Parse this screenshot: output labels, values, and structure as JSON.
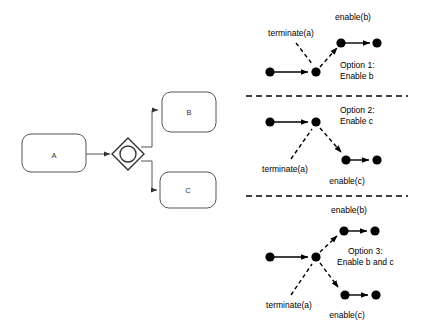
{
  "figure": {
    "background_color": "#ffffff",
    "width": 421,
    "height": 331
  },
  "bpmn": {
    "tasks": [
      {
        "id": "a",
        "label": "A",
        "x": 22,
        "y": 134,
        "w": 64,
        "h": 38
      },
      {
        "id": "b",
        "label": "B",
        "x": 162,
        "y": 92,
        "w": 54,
        "h": 40
      },
      {
        "id": "c",
        "label": "C",
        "x": 160,
        "y": 172,
        "w": 56,
        "h": 36
      }
    ],
    "gateway": {
      "type": "event-based-gateway",
      "cx": 128,
      "cy": 154,
      "half": 16
    },
    "flows": [
      {
        "from": "A",
        "to": "gateway"
      },
      {
        "from": "gateway",
        "to": "B"
      },
      {
        "from": "gateway",
        "to": "C"
      }
    ]
  },
  "options": [
    {
      "id": "option-1",
      "title": "Option 1:",
      "subtitle": "Enable b",
      "transition_label": "terminate(a)",
      "place_labels": [
        "enable(b)"
      ]
    },
    {
      "id": "option-2",
      "title": "Option 2:",
      "subtitle": "Enable c",
      "transition_label": "terminate(a)",
      "place_labels": [
        "enable(c)"
      ]
    },
    {
      "id": "option-3",
      "title": "Option 3:",
      "subtitle": "Enable b and c",
      "transition_label": "terminate(a)",
      "place_labels": [
        "enable(b)",
        "enable(c)"
      ]
    }
  ],
  "colors": {
    "stroke_dark": "#000000",
    "stroke_box": "#555555",
    "text_muted": "#333333",
    "background": "#ffffff"
  }
}
